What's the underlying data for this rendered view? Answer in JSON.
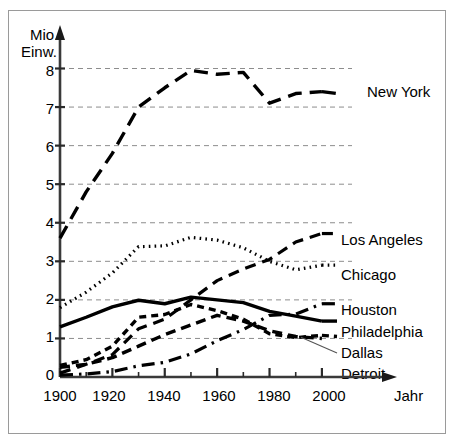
{
  "chart_data": {
    "type": "line",
    "title": "",
    "subtitle": "",
    "xlabel": "Jahr",
    "ylabel": "Mio. Einw.",
    "ylabel_line1": "Mio.",
    "ylabel_line2": "Einw.",
    "x": [
      1900,
      1910,
      1920,
      1930,
      1940,
      1950,
      1960,
      1970,
      1980,
      1990,
      2000
    ],
    "xlim": [
      1900,
      2005
    ],
    "ylim": [
      0,
      8.4
    ],
    "xticks": [
      "1900",
      "1920",
      "1940",
      "1960",
      "1980",
      "2000"
    ],
    "xtick_values": [
      1900,
      1920,
      1940,
      1960,
      1980,
      2000
    ],
    "yticks": [
      "0",
      "1",
      "2",
      "3",
      "4",
      "5",
      "6",
      "7",
      "8"
    ],
    "ytick_values": [
      0,
      1,
      2,
      3,
      4,
      5,
      6,
      7,
      8
    ],
    "grid": "horizontal-dashed",
    "legend_position": "right-inline",
    "series": [
      {
        "name": "New York",
        "style": "long-dash",
        "dash": "14,8",
        "width": 3.4,
        "color": "#000000",
        "values": [
          3.6,
          4.8,
          5.8,
          7.0,
          7.5,
          7.95,
          7.85,
          7.9,
          7.1,
          7.35,
          7.4
        ],
        "label_y": 7.35
      },
      {
        "name": "Los Angeles",
        "style": "dash",
        "dash": "11,7",
        "width": 3.2,
        "color": "#000000",
        "values": [
          0.1,
          0.33,
          0.58,
          1.25,
          1.5,
          2.0,
          2.5,
          2.8,
          3.05,
          3.5,
          3.72
        ],
        "label_y": 3.72
      },
      {
        "name": "Chicago",
        "style": "dotted",
        "dash": "1.6,4.2",
        "width": 3.2,
        "color": "#000000",
        "values": [
          1.8,
          2.2,
          2.7,
          3.38,
          3.4,
          3.62,
          3.55,
          3.35,
          3.0,
          2.78,
          2.9
        ],
        "label_y": 2.9
      },
      {
        "name": "Houston",
        "style": "dash-dot",
        "dash": "13,6,2.5,6",
        "width": 3.2,
        "color": "#000000",
        "values": [
          0.05,
          0.08,
          0.14,
          0.29,
          0.38,
          0.6,
          0.94,
          1.23,
          1.6,
          1.63,
          1.9
        ],
        "label_y": 1.9
      },
      {
        "name": "Philadelphia",
        "style": "solid",
        "dash": "0",
        "width": 3.4,
        "color": "#000000",
        "values": [
          1.3,
          1.55,
          1.82,
          1.99,
          1.9,
          2.07,
          2.0,
          1.93,
          1.7,
          1.58,
          1.45
        ],
        "label_y": 1.45
      },
      {
        "name": "Dallas",
        "style": "short-dash",
        "dash": "7,5",
        "width": 3.4,
        "color": "#000000",
        "values": [
          0.3,
          0.45,
          0.8,
          1.55,
          1.62,
          1.88,
          1.72,
          1.5,
          1.12,
          1.02,
          1.08
        ],
        "label_y": 1.05
      },
      {
        "name": "Detroit",
        "style": "medium-dash",
        "dash": "10,6",
        "width": 3.4,
        "color": "#000000",
        "values": [
          0.25,
          0.33,
          0.5,
          0.8,
          1.1,
          1.35,
          1.6,
          1.45,
          1.2,
          1.05,
          1.0
        ],
        "label_y": 0.62,
        "has_leader_line": true
      }
    ]
  },
  "legend": {
    "entries": [
      {
        "label": "New York"
      },
      {
        "label": "Los Angeles"
      },
      {
        "label": "Chicago"
      },
      {
        "label": "Houston"
      },
      {
        "label": "Philadelphia"
      },
      {
        "label": "Dallas"
      },
      {
        "label": "Detroit"
      }
    ]
  }
}
